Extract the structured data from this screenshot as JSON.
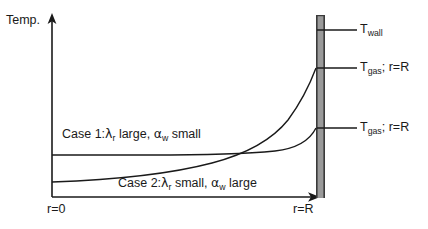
{
  "figure": {
    "type": "temperature-profile-diagram",
    "axes": {
      "y_axis_title": "Temp.",
      "x_axis_start_label": "r=0",
      "x_axis_end_label": "r=R"
    },
    "curves": [
      {
        "id": "case1",
        "label_prefix": "Case 1:",
        "label_lambda": "λ",
        "label_lambda_sub": "r",
        "label_mid": " large, ",
        "label_alpha": "α",
        "label_alpha_sub": "w",
        "label_end": " small",
        "full_label": "Case 1:λr large, αw small",
        "description": "flat profile, low wall temperature jump"
      },
      {
        "id": "case2",
        "label_prefix": "Case 2:",
        "label_lambda": "λ",
        "label_lambda_sub": "r",
        "label_mid": " small, ",
        "label_alpha": "α",
        "label_alpha_sub": "w",
        "label_end": " large",
        "full_label": "Case 2:λr small, αw large",
        "description": "steep profile, large wall temperature jump"
      }
    ],
    "right_labels": [
      {
        "id": "t-wall",
        "symbol": "T",
        "subscript": "wall",
        "suffix": ""
      },
      {
        "id": "t-gas-1",
        "symbol": "T",
        "subscript": "gas",
        "suffix": "; r=R"
      },
      {
        "id": "t-gas-2",
        "symbol": "T",
        "subscript": "gas",
        "suffix": "; r=R"
      }
    ],
    "wall": {
      "name": "wall",
      "fill_color": "#9a9a9a",
      "edge_color": "#3a3a3a"
    },
    "colors": {
      "line": "#1a1a1a",
      "background": "#ffffff"
    }
  }
}
